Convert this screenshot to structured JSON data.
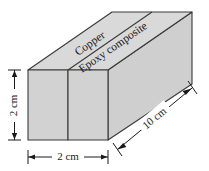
{
  "figure": {
    "type": "technical-diagram",
    "materials": [
      {
        "name": "Copper",
        "position": "front-left-slab"
      },
      {
        "name": "Epoxy composite",
        "position": "front-right-slab"
      }
    ],
    "labels": {
      "copper": "Copper",
      "epoxy": "Epoxy composite"
    },
    "dimensions": [
      {
        "id": "height",
        "value": "2 cm",
        "orientation": "vertical",
        "side": "left"
      },
      {
        "id": "width",
        "value": "2 cm",
        "orientation": "horizontal",
        "side": "bottom"
      },
      {
        "id": "depth",
        "value": "10 cm",
        "orientation": "diagonal",
        "side": "bottom-right"
      }
    ],
    "dimension_values": {
      "height": "2 cm",
      "width": "2 cm",
      "depth": "10 cm"
    },
    "colors": {
      "front_face": "#d2d2d2",
      "top_face": "#d9d9d9",
      "side_face": "#cccccc",
      "outline": "#3a3a3a",
      "background": "#ffffff",
      "text": "#1a1a1a"
    }
  }
}
